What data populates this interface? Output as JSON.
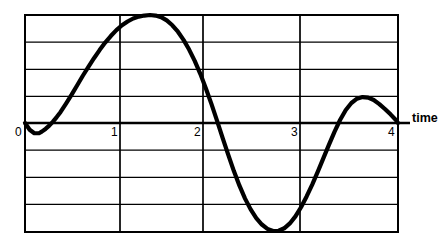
{
  "chart_data": {
    "type": "line",
    "title": "",
    "xlabel": "time",
    "ylabel": "",
    "grid": true,
    "legend": false,
    "xlim": [
      0,
      4
    ],
    "ylim": [
      -4,
      4
    ],
    "x_ticks": [
      {
        "value": 0,
        "label": "0"
      },
      {
        "value": 1,
        "label": "1"
      },
      {
        "value": 2,
        "label": "2"
      },
      {
        "value": 3,
        "label": "3"
      },
      {
        "value": 4,
        "label": "4"
      }
    ],
    "y_ticks": [
      {
        "value": 4,
        "label": ""
      },
      {
        "value": 3,
        "label": ""
      },
      {
        "value": 2,
        "label": ""
      },
      {
        "value": 1,
        "label": ""
      },
      {
        "value": 0,
        "label": ""
      },
      {
        "value": -1,
        "label": ""
      },
      {
        "value": -2,
        "label": ""
      },
      {
        "value": -3,
        "label": ""
      },
      {
        "value": -4,
        "label": ""
      }
    ],
    "series": [
      {
        "name": "waveform",
        "color": "#000000",
        "x": [
          0.0,
          0.05,
          0.1,
          0.15,
          0.18,
          0.22,
          0.26,
          0.3,
          0.34,
          0.38,
          0.44,
          0.5,
          0.56,
          0.62,
          0.68,
          0.74,
          0.8,
          0.86,
          0.92,
          0.98,
          1.04,
          1.1,
          1.16,
          1.22,
          1.28,
          1.34,
          1.4,
          1.46,
          1.52,
          1.58,
          1.64,
          1.7,
          1.76,
          1.82,
          1.88,
          1.94,
          2.0,
          2.06,
          2.12,
          2.18,
          2.24,
          2.3,
          2.36,
          2.42,
          2.48,
          2.54,
          2.6,
          2.66,
          2.72,
          2.78,
          2.84,
          2.9,
          2.96,
          3.02,
          3.08,
          3.14,
          3.2,
          3.26,
          3.32,
          3.38,
          3.44,
          3.5,
          3.56,
          3.62,
          3.68,
          3.74,
          3.8,
          3.86,
          3.92,
          3.98,
          4.0
        ],
        "y": [
          0.0,
          -0.25,
          -0.38,
          -0.38,
          -0.32,
          -0.22,
          -0.1,
          0.05,
          0.22,
          0.4,
          0.72,
          1.05,
          1.4,
          1.75,
          2.08,
          2.4,
          2.7,
          2.98,
          3.22,
          3.44,
          3.62,
          3.76,
          3.87,
          3.94,
          3.98,
          4.0,
          3.98,
          3.92,
          3.8,
          3.62,
          3.38,
          3.08,
          2.72,
          2.3,
          1.82,
          1.28,
          0.7,
          0.08,
          -0.56,
          -1.18,
          -1.78,
          -2.32,
          -2.8,
          -3.2,
          -3.52,
          -3.76,
          -3.92,
          -4.0,
          -3.99,
          -3.9,
          -3.72,
          -3.46,
          -3.12,
          -2.72,
          -2.28,
          -1.8,
          -1.3,
          -0.8,
          -0.32,
          0.12,
          0.48,
          0.74,
          0.9,
          0.96,
          0.94,
          0.85,
          0.7,
          0.52,
          0.32,
          0.1,
          0.0
        ]
      }
    ],
    "annotations": [
      {
        "name": "time-axis-label",
        "text": "time",
        "x": 4.15,
        "y": 0.15
      }
    ]
  },
  "axis": {
    "time_label": "time"
  },
  "geometry": {
    "plot_left": 25,
    "plot_right": 398,
    "plot_top": 15,
    "plot_bottom": 232,
    "zero_line_y": 123,
    "row_height": 27.125,
    "col_positions": [
      25,
      120,
      203,
      300,
      398
    ]
  }
}
